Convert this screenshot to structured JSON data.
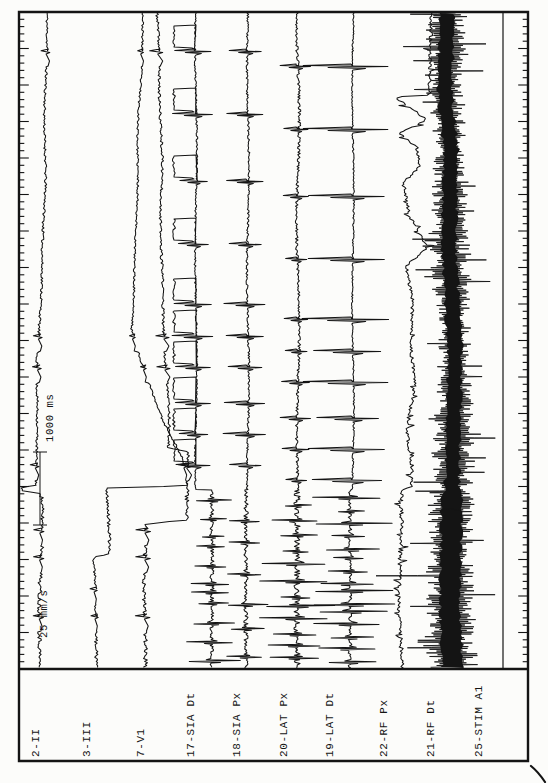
{
  "page": {
    "background": "#fcfcfa",
    "ink": "#141414"
  },
  "chart_data": {
    "type": "line",
    "sweep_speed_label": "25 mm/s",
    "time_scale_label": "1000 ms",
    "legend_position": "bottom-strip-rotated",
    "grid": "off",
    "time_axis": {
      "px_per_second": 73,
      "minor_tick_ms": 100,
      "major_tick_ms": 500,
      "total_span_ms": 9000
    },
    "section_break_y": 490,
    "upper_beat_times": [
      52,
      115,
      182,
      245,
      305,
      337,
      368,
      404,
      435,
      466
    ],
    "lower_beat_times": [
      505,
      531,
      558,
      590,
      617,
      646
    ],
    "channel_labels": [
      "2-II",
      "3-III",
      "7-V1",
      "17-SIA Dt",
      "18-SIA Px",
      "20-LAT Px",
      "19-LAT Dt",
      "22-RF Px",
      "21-RF Dt",
      "25-STIM A1"
    ],
    "channels": [
      {
        "label": "2-II",
        "label_x": 35,
        "type": "ecg",
        "seed": 11,
        "noise": 1.2,
        "spike": 6,
        "t": 2.4,
        "lower_spike": 7,
        "skip_lower_before": 493,
        "base": [
          [
            13,
            48
          ],
          [
            150,
            45
          ],
          [
            250,
            42
          ],
          [
            420,
            37
          ],
          [
            486,
            36
          ],
          [
            487,
            21
          ],
          [
            491,
            21
          ],
          [
            493,
            41
          ],
          [
            668,
            40
          ]
        ]
      },
      {
        "label": "3-III",
        "label_x": 86,
        "type": "ecg",
        "seed": 23,
        "noise": 1.0,
        "spike": 4,
        "t": 1.8,
        "lower_spike": 5,
        "skip_lower_before": 558,
        "base": [
          [
            13,
            143
          ],
          [
            200,
            137
          ],
          [
            330,
            131
          ],
          [
            420,
            163
          ],
          [
            460,
            184
          ],
          [
            486,
            188
          ],
          [
            488,
            108
          ],
          [
            554,
            108
          ],
          [
            557,
            92
          ],
          [
            600,
            96
          ],
          [
            668,
            96
          ]
        ]
      },
      {
        "label": "7-V1",
        "label_x": 140,
        "type": "ecg",
        "seed": 37,
        "noise": 1.3,
        "spike": 9,
        "t": 4,
        "lower_spike": 10,
        "skip_lower_before": 524,
        "base": [
          [
            13,
            158
          ],
          [
            250,
            162
          ],
          [
            430,
            168
          ],
          [
            448,
            168
          ],
          [
            452,
            188
          ],
          [
            520,
            186
          ],
          [
            524,
            146
          ],
          [
            668,
            145
          ]
        ]
      },
      {
        "label": "17-SIA Dt",
        "label_x": 190,
        "type": "egm",
        "seed": 41,
        "baseU": 196,
        "baseL": 212,
        "ampU": 20,
        "nz": 0.9,
        "square": true,
        "delay": 0,
        "af": {
          "gap": [
            7,
            20
          ],
          "amp": [
            8,
            32
          ]
        }
      },
      {
        "label": "18-SIA Px",
        "label_x": 236,
        "type": "egm",
        "seed": 53,
        "baseU": 248,
        "baseL": 246,
        "ampU": 22,
        "nz": 1.0,
        "square": false,
        "delay": 0,
        "af": {
          "gap": [
            14,
            34
          ],
          "amp": [
            10,
            26
          ]
        }
      },
      {
        "label": "20-LAT Px",
        "label_x": 283,
        "type": "egm",
        "seed": 67,
        "baseU": 298,
        "baseL": 297,
        "ampU": 15,
        "nz": 1.4,
        "square": false,
        "delay": 15,
        "af": {
          "gap": [
            7,
            17
          ],
          "amp": [
            12,
            38
          ]
        }
      },
      {
        "label": "19-LAT Dt",
        "label_x": 329,
        "type": "egm",
        "seed": 71,
        "baseU": 353,
        "baseL": 350,
        "ampU": 44,
        "nz": 0.8,
        "square": false,
        "delay": 15,
        "af": {
          "gap": [
            6,
            14
          ],
          "amp": [
            14,
            46
          ]
        }
      },
      {
        "label": "22-RF Px",
        "label_x": 383,
        "type": "rf",
        "seed": 83,
        "noise": 1.7,
        "base": [
          [
            13,
            430
          ],
          [
            95,
            431
          ],
          [
            97,
            396
          ],
          [
            110,
            415
          ],
          [
            120,
            427
          ],
          [
            133,
            399
          ],
          [
            147,
            416
          ],
          [
            166,
            419
          ],
          [
            183,
            402
          ],
          [
            215,
            409
          ],
          [
            248,
            428
          ],
          [
            266,
            407
          ],
          [
            300,
            413
          ],
          [
            345,
            409
          ],
          [
            385,
            415
          ],
          [
            430,
            408
          ],
          [
            470,
            412
          ],
          [
            487,
            410
          ],
          [
            490,
            400
          ],
          [
            668,
            401
          ]
        ]
      },
      {
        "label": "21-RF Dt",
        "label_x": 430,
        "type": "band",
        "seed": 97,
        "hw0": 13,
        "hwr": 8,
        "center": [
          [
            13,
            447
          ],
          [
            97,
            445
          ],
          [
            150,
            451
          ],
          [
            250,
            449
          ],
          [
            350,
            455
          ],
          [
            490,
            452
          ],
          [
            600,
            450
          ],
          [
            668,
            452
          ]
        ]
      },
      {
        "label": "25-STIM A1",
        "label_x": 478,
        "type": "flat",
        "seed": 5,
        "x": 503
      }
    ]
  },
  "layout": {
    "left": 19,
    "right": 528,
    "top": 12,
    "plot_bottom": 669,
    "outer_bottom": 761,
    "minor_tick_px": 7.3,
    "minor_len": 4.5,
    "major_len": 9,
    "scale_bar": {
      "x": 40,
      "y1": 452,
      "y2": 525,
      "cap_half": 7
    },
    "time_label_anchor": {
      "x": 53,
      "y": 442
    },
    "speed_label_anchor": {
      "x": 47,
      "y": 638
    },
    "label_baseline_y": 757,
    "trace_start_y": 13,
    "trace_end_y": 668
  }
}
